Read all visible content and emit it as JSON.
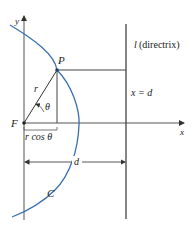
{
  "diagram": {
    "type": "conic-polar-directrix",
    "colors": {
      "curve": "#3a6fb0",
      "lines": "#333333",
      "text": "#222222",
      "background": "#ffffff"
    },
    "labels": {
      "y_axis": "y",
      "x_axis": "x",
      "point": "P",
      "focus": "F",
      "radius": "r",
      "angle": "θ",
      "r_cos": "r cos θ",
      "directrix_l": "l",
      "directrix_text": "(directrix)",
      "directrix_eq": "x = d",
      "distance": "d",
      "curve": "C"
    }
  }
}
